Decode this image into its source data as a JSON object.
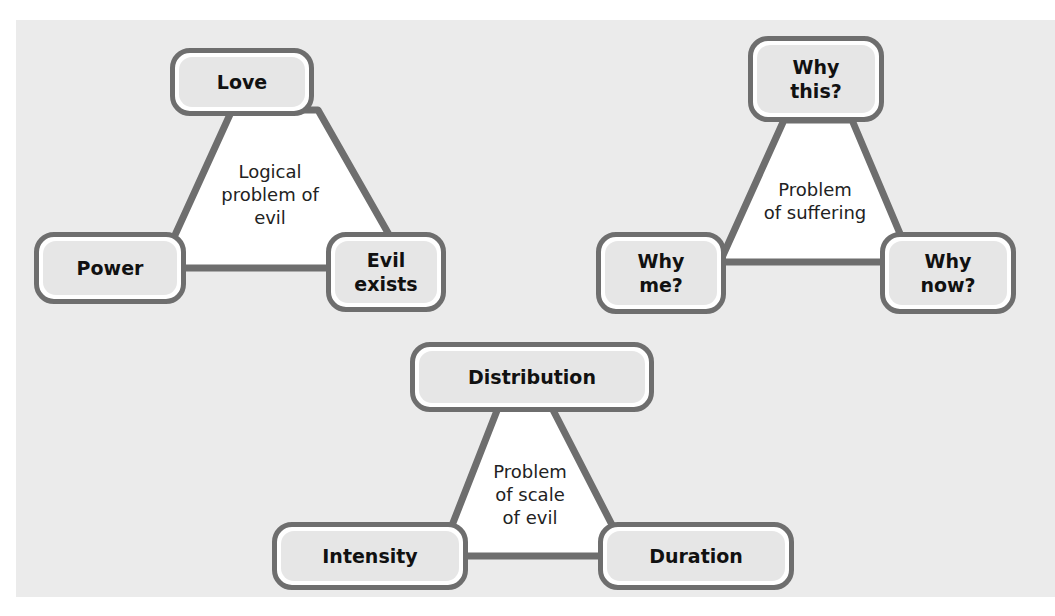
{
  "colors": {
    "background": "#ebebeb",
    "line": "#6e6e6e",
    "node_fill": "#e6e6e6",
    "triangle_fill": "#ffffff",
    "text": "#111111"
  },
  "diagrams": [
    {
      "center_label": "Logical problem of evil",
      "center_lines": [
        "Logical",
        "problem of",
        "evil"
      ],
      "nodes": {
        "top": "Love",
        "left": "Power",
        "right": "Evil exists",
        "right_lines": [
          "Evil",
          "exists"
        ]
      }
    },
    {
      "center_label": "Problem of suffering",
      "center_lines": [
        "Problem",
        "of suffering"
      ],
      "nodes": {
        "top": "Why this?",
        "top_lines": [
          "Why",
          "this?"
        ],
        "left": "Why me?",
        "left_lines": [
          "Why",
          "me?"
        ],
        "right": "Why now?",
        "right_lines": [
          "Why",
          "now?"
        ]
      }
    },
    {
      "center_label": "Problem of scale of evil",
      "center_lines": [
        "Problem",
        "of scale",
        "of evil"
      ],
      "nodes": {
        "top": "Distribution",
        "left": "Intensity",
        "right": "Duration"
      }
    }
  ]
}
